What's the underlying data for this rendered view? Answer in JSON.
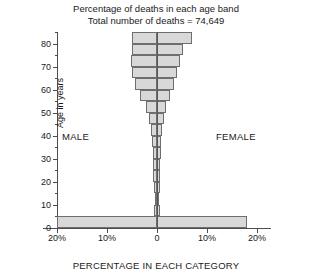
{
  "title": {
    "line1": "Percentage of deaths in each age band",
    "line2": "Total number of deaths = 74,649"
  },
  "axes": {
    "ylabel": "Age in years",
    "xlabel": "PERCENTAGE IN EACH CATEGORY",
    "ytick_labels": [
      "0",
      "10",
      "20",
      "30",
      "40",
      "50",
      "60",
      "70",
      "80"
    ],
    "xtick_labels": [
      "20%",
      "10%",
      "0",
      "10%",
      "20%"
    ]
  },
  "annotations": {
    "male": "MALE",
    "female": "FEMALE"
  },
  "colors": {
    "bar_fill": "#d8d8d8",
    "bar_border": "#6e6e6e",
    "axis": "#4d4d4d",
    "text": "#1a1a1a",
    "background": "#ffffff"
  },
  "chart_data": {
    "type": "bar",
    "subtype": "population-pyramid",
    "title": "Percentage of deaths in each age band",
    "subtitle": "Total number of deaths = 74,649",
    "total_deaths": 74649,
    "xlabel": "PERCENTAGE IN EACH CATEGORY",
    "ylabel": "Age in years",
    "xlim": [
      -20,
      20
    ],
    "ylim": [
      0,
      85
    ],
    "xtick_values": [
      -20,
      -10,
      0,
      10,
      20
    ],
    "xtick_labels": [
      "20%",
      "10%",
      "0",
      "10%",
      "20%"
    ],
    "ytick_values": [
      0,
      10,
      20,
      30,
      40,
      50,
      60,
      70,
      80
    ],
    "grid": false,
    "legend": "none",
    "orientation": "horizontal",
    "band_width_years": 5,
    "categories": [
      "0-5",
      "5-10",
      "10-15",
      "15-20",
      "20-25",
      "25-30",
      "30-35",
      "35-40",
      "40-45",
      "45-50",
      "50-55",
      "55-60",
      "60-65",
      "65-70",
      "70-75",
      "75-80",
      "80-85"
    ],
    "band_start_age": [
      0,
      5,
      10,
      15,
      20,
      25,
      30,
      35,
      40,
      45,
      50,
      55,
      60,
      65,
      70,
      75,
      80
    ],
    "series": [
      {
        "name": "MALE",
        "side": "left",
        "values": [
          20.0,
          0.6,
          0.4,
          0.7,
          0.8,
          0.8,
          0.9,
          1.0,
          1.3,
          1.7,
          2.3,
          3.4,
          4.4,
          5.0,
          5.2,
          5.1,
          5.1
        ]
      },
      {
        "name": "FEMALE",
        "side": "right",
        "values": [
          18.0,
          0.5,
          0.4,
          0.5,
          0.6,
          0.6,
          0.7,
          0.8,
          1.0,
          1.3,
          1.7,
          2.5,
          3.3,
          4.0,
          4.6,
          5.2,
          7.0
        ]
      }
    ]
  }
}
